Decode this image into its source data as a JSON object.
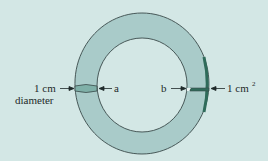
{
  "diagram": {
    "type": "ring-cross-sections",
    "colors": {
      "background": "#d3e7e5",
      "ring_fill": "#a9cbc9",
      "band_fill": "#7fb0a8",
      "highlight": "#2f6b5a",
      "stroke": "#3a4a4a"
    },
    "labels": {
      "left_size": "1 cm",
      "left_size_sub": "diameter",
      "point_a": "a",
      "point_b": "b",
      "right_size": "1 cm",
      "right_size_sup": "2"
    }
  }
}
